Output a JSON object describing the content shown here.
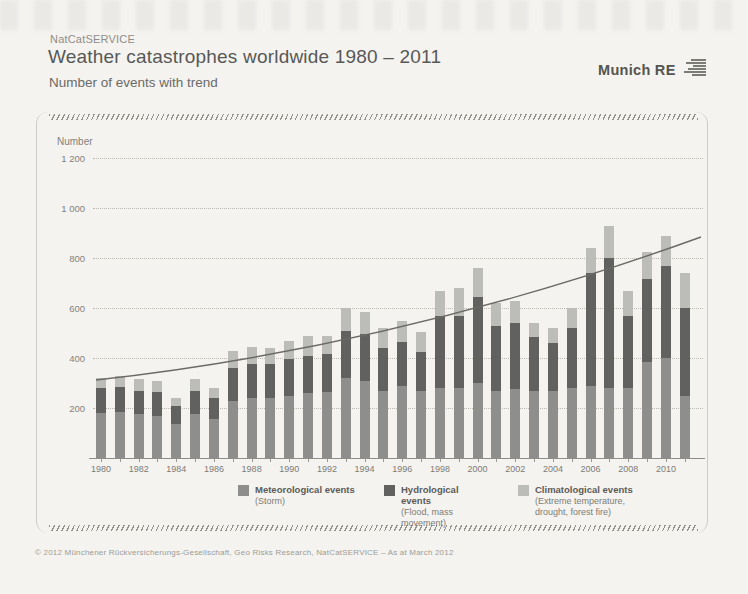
{
  "header": {
    "eyebrow": "NatCatSERVICE",
    "title": "Weather catastrophes worldwide 1980 – 2011",
    "subtitle": "Number of events with trend",
    "logo_text": "Munich RE"
  },
  "chart_data": {
    "type": "bar",
    "stacked": true,
    "title": "Weather catastrophes worldwide 1980 – 2011",
    "subtitle": "Number of events with trend",
    "ylabel": "Number",
    "xlabel": "",
    "ylim": [
      0,
      1200
    ],
    "yticks": [
      200,
      400,
      600,
      800,
      1000,
      1200
    ],
    "ytick_labels": [
      "200",
      "400",
      "600",
      "800",
      "1 000",
      "1 200"
    ],
    "grid": "dotted horizontal",
    "legend_position": "bottom",
    "categories": [
      1980,
      1981,
      1982,
      1983,
      1984,
      1985,
      1986,
      1987,
      1988,
      1989,
      1990,
      1991,
      1992,
      1993,
      1994,
      1995,
      1996,
      1997,
      1998,
      1999,
      2000,
      2001,
      2002,
      2003,
      2004,
      2005,
      2006,
      2007,
      2008,
      2009,
      2010,
      2011
    ],
    "xtick_label_years": [
      1980,
      1982,
      1984,
      1986,
      1988,
      1990,
      1992,
      1994,
      1996,
      1998,
      2000,
      2002,
      2004,
      2006,
      2008,
      2010
    ],
    "series": [
      {
        "name": "Meteorological events",
        "detail": "(Storm)",
        "color": "#8e8e8c",
        "values": [
          180,
          185,
          175,
          170,
          135,
          175,
          155,
          230,
          240,
          240,
          250,
          260,
          265,
          320,
          310,
          270,
          290,
          270,
          280,
          280,
          300,
          270,
          275,
          270,
          270,
          280,
          290,
          280,
          280,
          385,
          400,
          250
        ]
      },
      {
        "name": "Hydrological events",
        "detail": "(Flood, mass movement)",
        "color": "#616160",
        "values": [
          100,
          100,
          95,
          95,
          75,
          95,
          85,
          130,
          135,
          135,
          145,
          150,
          150,
          190,
          185,
          170,
          175,
          155,
          290,
          290,
          345,
          260,
          265,
          215,
          190,
          240,
          450,
          520,
          290,
          330,
          370,
          350
        ]
      },
      {
        "name": "Climatological events",
        "detail": "(Extreme temperature, drought, forest fire)",
        "color": "#bcbcb8",
        "values": [
          40,
          45,
          45,
          45,
          30,
          45,
          40,
          70,
          70,
          65,
          75,
          80,
          75,
          90,
          90,
          80,
          85,
          80,
          100,
          110,
          115,
          90,
          90,
          55,
          60,
          80,
          100,
          130,
          100,
          110,
          120,
          140
        ]
      }
    ],
    "totals": [
      320,
      330,
      315,
      310,
      240,
      315,
      280,
      430,
      445,
      440,
      470,
      490,
      490,
      600,
      585,
      520,
      550,
      505,
      670,
      680,
      760,
      620,
      630,
      540,
      520,
      600,
      840,
      930,
      670,
      825,
      890,
      740
    ],
    "trend": {
      "label": "trend",
      "shape": "slightly convex upward curve",
      "start": {
        "year": 1980,
        "value": 310
      },
      "end": {
        "year": 2011,
        "value": 885
      },
      "color": "#6a6a66"
    }
  },
  "footer": {
    "copyright": "© 2012 Münchener Rückversicherungs-Gesellschaft, Geo Risks Research, NatCatSERVICE – As at March 2012"
  }
}
